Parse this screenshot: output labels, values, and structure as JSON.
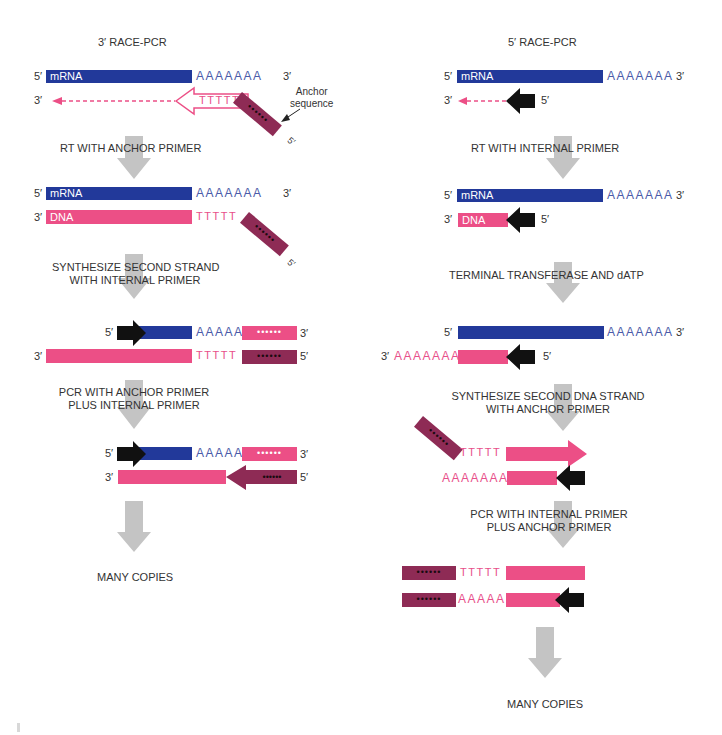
{
  "left_panel": {
    "title": "3′ RACE-PCR",
    "mrna_label": "mRNA",
    "dna_label": "DNA",
    "polyA7": "AAAAAAA",
    "polyA5": "AAAAA",
    "polyT5": "TTTTT",
    "anchor_callout": [
      "Anchor",
      "sequence"
    ],
    "ends": {
      "five": "5′",
      "three": "3′",
      "five_tilted": "5′"
    },
    "steps": [
      {
        "lines": [
          "RT WITH ANCHOR PRIMER"
        ]
      },
      {
        "lines": [
          "SYNTHESIZE SECOND STRAND",
          "WITH INTERNAL PRIMER"
        ]
      },
      {
        "lines": [
          "PCR WITH ANCHOR PRIMER",
          "PLUS INTERNAL PRIMER"
        ]
      },
      {
        "lines": [
          "MANY COPIES"
        ]
      }
    ],
    "dots": "••••••"
  },
  "right_panel": {
    "title": "5′ RACE-PCR",
    "mrna_label": "mRNA",
    "dna_label": "DNA",
    "polyA7": "AAAAAAA",
    "polyA5": "AAAAA",
    "polyT5": "TTTTT",
    "ends": {
      "five": "5′",
      "three": "3′"
    },
    "steps": [
      {
        "lines": [
          "RT WITH INTERNAL  PRIMER"
        ]
      },
      {
        "lines": [
          "TERMINAL TRANSFERASE AND dATP"
        ]
      },
      {
        "lines": [
          "SYNTHESIZE SECOND DNA STRAND",
          "WITH ANCHOR PRIMER"
        ]
      },
      {
        "lines": [
          "PCR WITH INTERNAL PRIMER",
          "PLUS ANCHOR PRIMER"
        ]
      },
      {
        "lines": [
          "MANY COPIES"
        ]
      }
    ],
    "dots": "••••••"
  },
  "colors": {
    "mrna_blue": "#22399a",
    "dna_pink": "#ec4f86",
    "anchor_maroon": "#8e2b55",
    "primer_black": "#111111",
    "process_arrow_gray": "#c4c4c4",
    "polyA_blue_text": "#4a5aa8"
  }
}
